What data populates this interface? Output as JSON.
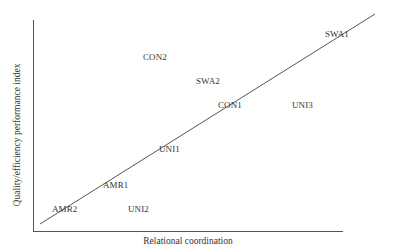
{
  "chart_data": {
    "type": "scatter",
    "title": "",
    "xlabel": "Relational coordination",
    "ylabel": "Quality/efficiency performance index",
    "grid": false,
    "legend": null,
    "axis_ticks": "none",
    "points": [
      {
        "label": "AMR2",
        "x": 0.07,
        "y": 0.1,
        "px": 52,
        "py": 209
      },
      {
        "label": "UNI2",
        "x": 0.31,
        "y": 0.1,
        "px": 128,
        "py": 209
      },
      {
        "label": "AMR1",
        "x": 0.23,
        "y": 0.22,
        "px": 103,
        "py": 185
      },
      {
        "label": "UNI1",
        "x": 0.41,
        "y": 0.39,
        "px": 159,
        "py": 149
      },
      {
        "label": "CON1",
        "x": 0.6,
        "y": 0.6,
        "px": 218,
        "py": 105
      },
      {
        "label": "UNI3",
        "x": 0.83,
        "y": 0.6,
        "px": 292,
        "py": 105
      },
      {
        "label": "SWA2",
        "x": 0.53,
        "y": 0.72,
        "px": 196,
        "py": 81
      },
      {
        "label": "CON2",
        "x": 0.36,
        "y": 0.83,
        "px": 143,
        "py": 57
      },
      {
        "label": "SWA1",
        "x": 0.93,
        "y": 0.93,
        "px": 325,
        "py": 34
      }
    ],
    "trend_line": {
      "x1": 40,
      "y1": 224,
      "x2": 375,
      "y2": 14
    }
  }
}
